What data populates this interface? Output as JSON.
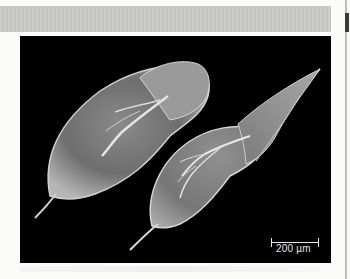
{
  "page": {
    "header_band_color": "#c9c9c8",
    "background_color": "#fbfbfa"
  },
  "figure": {
    "background_color": "#000000",
    "specimens": [
      {
        "name": "left-specimen",
        "orientation": "tilted, tail spine lower-left"
      },
      {
        "name": "right-specimen",
        "orientation": "elongated, head pointing upper-right, tail spine lower-left"
      }
    ],
    "scale_bar": {
      "label": "200 µm",
      "color": "#e6e6e6"
    }
  }
}
